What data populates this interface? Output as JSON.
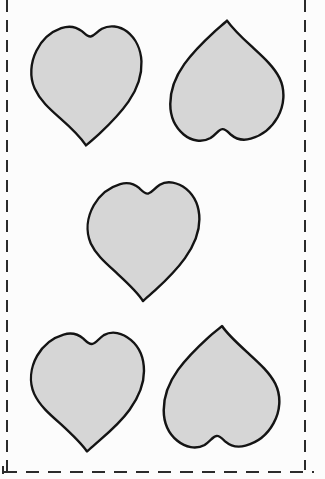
{
  "document": {
    "type": "printable-craft-template",
    "title": "Heart Cut-Out Template",
    "page_width": 325,
    "page_height": 479,
    "background_color": "#fcfcfc"
  },
  "colors": {
    "paper": "#fcfcfc",
    "shape_fill": "#d6d6d6",
    "shape_outline": "#141414",
    "cut_guide": "#2b2b2b"
  },
  "cut_guides": {
    "style": "dashed",
    "color": "#2b2b2b",
    "edges": [
      {
        "name": "left-cut-line",
        "orientation": "vertical",
        "label": "left cut guide"
      },
      {
        "name": "right-cut-line",
        "orientation": "vertical",
        "label": "right cut guide"
      },
      {
        "name": "bottom-cut-line",
        "orientation": "horizontal",
        "label": "bottom cut guide"
      }
    ],
    "dash_length": 12,
    "gap_length": 8,
    "stroke_width": 2
  },
  "shapes": {
    "count": 6,
    "kind": "heart",
    "fill": "#d6d6d6",
    "outline": "#141414",
    "items": [
      {
        "id": 1,
        "name": "heart-top-left",
        "label": "Heart 1",
        "orientation": "upright",
        "x": 27,
        "y": 14,
        "width": 118,
        "height": 135
      },
      {
        "id": 2,
        "name": "heart-top-right",
        "label": "Heart 2",
        "orientation": "inverted",
        "x": 166,
        "y": 17,
        "width": 122,
        "height": 136
      },
      {
        "id": 3,
        "name": "heart-middle-center",
        "label": "Heart 3",
        "orientation": "upright",
        "x": 83,
        "y": 170,
        "width": 120,
        "height": 134
      },
      {
        "id": 4,
        "name": "heart-bottom-left",
        "label": "Heart 4",
        "orientation": "upright",
        "x": 27,
        "y": 321,
        "width": 120,
        "height": 134
      },
      {
        "id": 5,
        "name": "heart-bottom-right",
        "label": "Heart 5",
        "orientation": "inverted",
        "x": 160,
        "y": 323,
        "width": 124,
        "height": 137
      }
    ]
  }
}
